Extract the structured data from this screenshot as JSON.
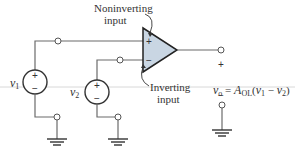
{
  "diagram": {
    "opamp": {
      "fill_color": "#c9d6e3",
      "plus_sign": "+",
      "minus_sign": "−"
    },
    "labels": {
      "noninverting_line1": "Noninverting",
      "noninverting_line2": "input",
      "inverting_line1": "Inverting",
      "inverting_line2": "input"
    },
    "sources": [
      {
        "name": "v",
        "subscript": "1",
        "plus": "+",
        "minus": "−"
      },
      {
        "name": "v",
        "subscript": "2",
        "plus": "+",
        "minus": "−"
      }
    ],
    "output": {
      "plus": "+",
      "minus": "−",
      "eq_v": "v",
      "eq_v_sub": "o",
      "eq_equals": " = ",
      "eq_A": "A",
      "eq_A_sub": "OL",
      "eq_open": "(",
      "eq_v1": "v",
      "eq_v1_sub": "1",
      "eq_minus": " − ",
      "eq_v2": "v",
      "eq_v2_sub": "2",
      "eq_close": ")"
    }
  }
}
